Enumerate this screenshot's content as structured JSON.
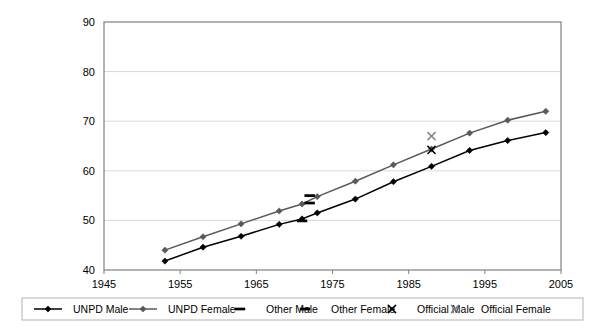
{
  "chart_data": {
    "type": "line",
    "title": "",
    "subtitle": "",
    "xlabel": "",
    "ylabel": "",
    "xlim": [
      1945,
      2005
    ],
    "ylim": [
      40,
      90
    ],
    "xticks": [
      1945,
      1955,
      1965,
      1975,
      1985,
      1995,
      2005
    ],
    "yticks": [
      40,
      50,
      60,
      70,
      80,
      90
    ],
    "xtick_labels": [
      "1945",
      "1955",
      "1965",
      "1975",
      "1985",
      "1995",
      "2005"
    ],
    "ytick_labels": [
      "40",
      "50",
      "60",
      "70",
      "80",
      "90"
    ],
    "grid": "horizontal",
    "legend_position": "bottom",
    "plot_border": true,
    "series": [
      {
        "name": "UNPD Male",
        "marker": "diamond",
        "style": "line-with-markers",
        "color": "#000000",
        "x": [
          1953,
          1958,
          1963,
          1968,
          1971,
          1973,
          1978,
          1983,
          1988,
          1993,
          1998,
          2003
        ],
        "values": [
          41.8,
          44.6,
          46.8,
          49.2,
          50.3,
          51.5,
          54.3,
          57.8,
          60.9,
          64.1,
          66.1,
          67.7
        ]
      },
      {
        "name": "UNPD Female",
        "marker": "diamond",
        "style": "line-with-markers",
        "color": "#595959",
        "x": [
          1953,
          1958,
          1963,
          1968,
          1971,
          1973,
          1978,
          1983,
          1988,
          1993,
          1998,
          2003
        ],
        "values": [
          44.0,
          46.7,
          49.3,
          51.9,
          53.3,
          54.8,
          57.9,
          61.2,
          64.4,
          67.6,
          70.2,
          72.0
        ]
      },
      {
        "name": "Other Male",
        "marker": "dash",
        "style": "markers-only",
        "color": "#000000",
        "x": [
          1971
        ],
        "values": [
          49.9
        ]
      },
      {
        "name": "Other Female",
        "marker": "dash",
        "style": "markers-only",
        "color": "#000000",
        "x": [
          1972,
          1972
        ],
        "values": [
          55.0,
          53.5
        ]
      },
      {
        "name": "Official Male",
        "marker": "cross",
        "style": "markers-only",
        "color": "#000000",
        "x": [
          1988
        ],
        "values": [
          64.2
        ]
      },
      {
        "name": "Official Female",
        "marker": "cross",
        "style": "markers-only",
        "color": "#7f7f7f",
        "x": [
          1988
        ],
        "values": [
          67.0
        ]
      }
    ],
    "legend": [
      {
        "label": "UNPD Male",
        "marker": "diamond",
        "line": true,
        "color": "#000000"
      },
      {
        "label": "UNPD Female",
        "marker": "diamond",
        "line": true,
        "color": "#595959"
      },
      {
        "label": "Other Male",
        "marker": "dash",
        "line": false,
        "color": "#000000"
      },
      {
        "label": "Other Female",
        "marker": "dash",
        "line": false,
        "color": "#000000"
      },
      {
        "label": "Official Male",
        "marker": "cross",
        "line": false,
        "color": "#000000"
      },
      {
        "label": "Official Female",
        "marker": "cross",
        "line": false,
        "color": "#7f7f7f"
      }
    ]
  }
}
